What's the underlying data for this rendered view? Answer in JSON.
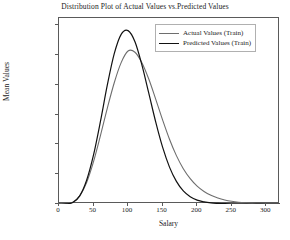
{
  "chart_data": {
    "type": "line",
    "title": "Distribution Plot of Actual Values vs.Predicted Values",
    "xlabel": "Salary",
    "ylabel": "Mean Values",
    "xlim": [
      0,
      320
    ],
    "ylim": [
      0,
      0.0125
    ],
    "xticks": [
      0,
      50,
      100,
      150,
      200,
      250,
      300
    ],
    "yticks": [
      "0.000",
      "0.002",
      "0.004",
      "0.006",
      "0.008",
      "0.010",
      "0.012"
    ],
    "ytick_values": [
      0.0,
      0.002,
      0.004,
      0.006,
      0.008,
      0.01,
      0.012
    ],
    "grid": false,
    "legend_position": "upper right",
    "series": [
      {
        "name": "Actual Values (Train)",
        "color": "#6e6e6e",
        "peak_x": 103,
        "peak_y": 0.0103,
        "x": [
          0,
          10,
          20,
          30,
          40,
          50,
          60,
          70,
          80,
          90,
          100,
          110,
          120,
          130,
          140,
          150,
          160,
          170,
          180,
          190,
          200,
          210,
          220,
          230,
          240,
          250,
          260,
          270,
          280,
          290,
          300,
          320
        ],
        "y": [
          0.0,
          2e-05,
          0.00012,
          0.00055,
          0.00145,
          0.00285,
          0.0046,
          0.00645,
          0.00815,
          0.0095,
          0.01028,
          0.0102,
          0.0095,
          0.0084,
          0.00705,
          0.00565,
          0.00435,
          0.00325,
          0.00237,
          0.0017,
          0.0012,
          0.00084,
          0.00058,
          0.0004,
          0.00027,
          0.00018,
          0.00012,
          8e-05,
          5e-05,
          3e-05,
          2e-05,
          1e-05
        ]
      },
      {
        "name": "Predicted Values (Train)",
        "color": "#111111",
        "peak_x": 98,
        "peak_y": 0.01168,
        "x": [
          0,
          10,
          20,
          30,
          40,
          50,
          60,
          70,
          80,
          90,
          100,
          110,
          120,
          130,
          140,
          150,
          160,
          170,
          180,
          190,
          200,
          210,
          220,
          230,
          240,
          250,
          260,
          270,
          280,
          290,
          300,
          320
        ],
        "y": [
          0.0,
          1e-05,
          0.0001,
          0.00055,
          0.0016,
          0.0033,
          0.00555,
          0.008,
          0.0101,
          0.0114,
          0.01165,
          0.0109,
          0.00935,
          0.00745,
          0.00552,
          0.00382,
          0.00248,
          0.00152,
          0.00088,
          0.00049,
          0.00026,
          0.00014,
          7e-05,
          4e-05,
          2e-05,
          1e-05,
          5e-06,
          2e-06,
          1e-06,
          0.0,
          0.0,
          0.0
        ]
      }
    ]
  },
  "legend": {
    "items": [
      {
        "label": "Actual Values (Train)"
      },
      {
        "label": "Predicted Values (Train)"
      }
    ]
  },
  "footer": {
    "clipped_text": ""
  }
}
